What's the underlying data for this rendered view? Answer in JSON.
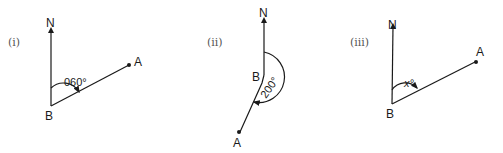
{
  "diagrams": [
    {
      "id": "i",
      "number_label": "(i)",
      "north_label": "N",
      "point_b_label": "B",
      "point_a_label": "A",
      "angle_label": "060°",
      "bearing_degrees": 60
    },
    {
      "id": "ii",
      "number_label": "(ii)",
      "north_label": "N",
      "point_b_label": "B",
      "point_a_label": "A",
      "angle_label": "200°",
      "bearing_degrees": 200
    },
    {
      "id": "iii",
      "number_label": "(iii)",
      "north_label": "N",
      "point_b_label": "B",
      "point_a_label": "A",
      "angle_label": "x°",
      "bearing_degrees": null
    }
  ],
  "colors": {
    "ink": "#1a1a1a",
    "number_label": "#555555",
    "background": "#ffffff"
  }
}
